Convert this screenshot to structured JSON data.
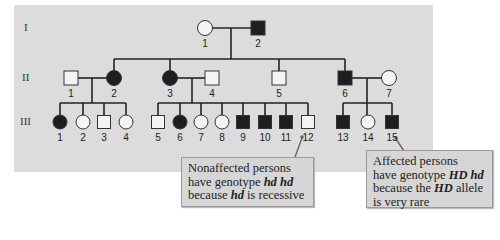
{
  "generations": [
    {
      "label": "I",
      "y": 28
    },
    {
      "label": "II",
      "y": 78
    },
    {
      "label": "III",
      "y": 122
    }
  ],
  "individuals": {
    "I": [
      {
        "id": "1",
        "sex": "female",
        "affected": false,
        "x": 205
      },
      {
        "id": "2",
        "sex": "male",
        "affected": true,
        "x": 258
      }
    ],
    "II": [
      {
        "id": "1",
        "sex": "male",
        "affected": false,
        "x": 71
      },
      {
        "id": "2",
        "sex": "female",
        "affected": true,
        "x": 114
      },
      {
        "id": "3",
        "sex": "female",
        "affected": true,
        "x": 170
      },
      {
        "id": "4",
        "sex": "male",
        "affected": false,
        "x": 212
      },
      {
        "id": "5",
        "sex": "male",
        "affected": false,
        "x": 279
      },
      {
        "id": "6",
        "sex": "male",
        "affected": true,
        "x": 345
      },
      {
        "id": "7",
        "sex": "female",
        "affected": false,
        "x": 389
      }
    ],
    "III": [
      {
        "id": "1",
        "sex": "female",
        "affected": true,
        "x": 60
      },
      {
        "id": "2",
        "sex": "female",
        "affected": false,
        "x": 83
      },
      {
        "id": "3",
        "sex": "male",
        "affected": false,
        "x": 104
      },
      {
        "id": "4",
        "sex": "female",
        "affected": false,
        "x": 126
      },
      {
        "id": "5",
        "sex": "male",
        "affected": false,
        "x": 158
      },
      {
        "id": "6",
        "sex": "female",
        "affected": true,
        "x": 180
      },
      {
        "id": "7",
        "sex": "female",
        "affected": false,
        "x": 201
      },
      {
        "id": "8",
        "sex": "female",
        "affected": false,
        "x": 222
      },
      {
        "id": "9",
        "sex": "male",
        "affected": true,
        "x": 243
      },
      {
        "id": "10",
        "sex": "male",
        "affected": true,
        "x": 265
      },
      {
        "id": "11",
        "sex": "male",
        "affected": true,
        "x": 286
      },
      {
        "id": "12",
        "sex": "male",
        "affected": false,
        "x": 308
      },
      {
        "id": "13",
        "sex": "male",
        "affected": true,
        "x": 343
      },
      {
        "id": "14",
        "sex": "female",
        "affected": false,
        "x": 368
      },
      {
        "id": "15",
        "sex": "male",
        "affected": true,
        "x": 392
      }
    ]
  },
  "callouts": {
    "nonaffected": {
      "line1": "Nonaffected persons",
      "line2_pre": "have genotype ",
      "line2_em": "hd hd",
      "line3_pre": "because ",
      "line3_em": "hd",
      "line3_post": " is recessive"
    },
    "affected": {
      "line1": "Affected persons",
      "line2_pre": "have genotype ",
      "line2_em": "HD hd",
      "line3_pre": "because the ",
      "line3_em": "HD",
      "line3_post": " allele",
      "line4": "is very rare"
    }
  },
  "colors": {
    "panel_bg": "#dcdcdc",
    "affected_fill": "#1e1e1e",
    "unaffected_fill": "#f4f4f4",
    "line": "#222222"
  }
}
